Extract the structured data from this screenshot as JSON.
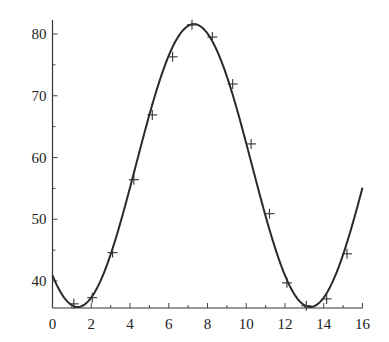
{
  "chart_data": {
    "type": "line",
    "title": "",
    "xlabel": "",
    "ylabel": "",
    "xlim": [
      0,
      16
    ],
    "ylim": [
      35.6,
      82.5
    ],
    "x_ticks": [
      0,
      2,
      4,
      6,
      8,
      10,
      12,
      14,
      16
    ],
    "x_tick_labels": [
      "0",
      "2",
      "4",
      "6",
      "8",
      "10",
      "12",
      "14",
      "16"
    ],
    "y_ticks": [
      40,
      50,
      60,
      70,
      80
    ],
    "y_tick_labels": [
      "40",
      "50",
      "60",
      "70",
      "80"
    ],
    "grid": false,
    "legend": null,
    "series": [
      {
        "name": "observed",
        "style": "markers",
        "marker": "plus",
        "x": [
          1.1,
          2.05,
          3.1,
          4.2,
          5.15,
          6.2,
          7.2,
          8.25,
          9.3,
          10.25,
          11.2,
          12.1,
          13.1,
          14.15,
          15.2
        ],
        "values": [
          36.3,
          37.3,
          44.6,
          56.4,
          66.9,
          76.3,
          81.5,
          79.5,
          71.9,
          62.2,
          50.9,
          39.7,
          36.0,
          37.1,
          44.4
        ]
      },
      {
        "name": "fitted curve",
        "style": "line",
        "model": "58.7 + 22.9*sin(2*pi*(x-4.3)/12)",
        "x": [
          0,
          1,
          2,
          3,
          4,
          5,
          6,
          7,
          8,
          9,
          10,
          11,
          12,
          13,
          14,
          15,
          16
        ],
        "values": [
          40.9,
          36.0,
          37.4,
          44.6,
          53.3,
          64.6,
          75.0,
          81.1,
          81.2,
          75.1,
          64.5,
          53.3,
          44.1,
          36.6,
          37.1,
          43.6,
          55.1
        ]
      }
    ]
  }
}
